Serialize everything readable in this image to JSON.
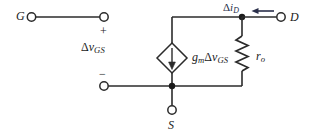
{
  "diagram": {
    "colors": {
      "wire": "#2b2b2b",
      "label": "#1b1b1b",
      "current_label": "#2a2f4a",
      "background": "#ffffff"
    },
    "terminals": [
      {
        "id": "gate",
        "label": "G",
        "x": 31,
        "y": 17
      },
      {
        "id": "gate_plus_node",
        "label": "",
        "x": 104,
        "y": 17
      },
      {
        "id": "gate_minus_node",
        "label": "",
        "x": 104,
        "y": 86
      },
      {
        "id": "drain",
        "label": "D",
        "x": 281,
        "y": 17
      },
      {
        "id": "source",
        "label": "S",
        "x": 172,
        "y": 110
      }
    ],
    "polarity": {
      "plus": "+",
      "minus": "−"
    },
    "labels": {
      "gate": "G",
      "drain": "D",
      "source": "S",
      "input_voltage": {
        "delta": "Δ",
        "symbol": "v",
        "subscript": "GS"
      },
      "dependent_source": {
        "gm": "g",
        "gm_sub": "m",
        "delta": "Δ",
        "symbol": "v",
        "subscript": "GS"
      },
      "output_resistance": {
        "symbol": "r",
        "subscript": "o"
      },
      "drain_current": {
        "delta": "Δ",
        "symbol": "i",
        "subscript": "D"
      }
    },
    "elements": [
      {
        "id": "dependent-current-source",
        "type": "diamond",
        "cx": 172,
        "cy": 58,
        "rx": 15,
        "ry": 15,
        "arrow": "down"
      },
      {
        "id": "output-resistor",
        "type": "resistor",
        "x": 242,
        "y_top": 36,
        "y_bottom": 74,
        "orientation": "vertical"
      },
      {
        "id": "drain-current-arrow",
        "type": "arrow",
        "direction": "left",
        "x_from": 274,
        "x_to": 252,
        "y": 11
      }
    ],
    "nodes": [
      {
        "id": "drain-node",
        "x": 242,
        "y": 17
      },
      {
        "id": "source-node",
        "x": 172,
        "y": 86
      }
    ]
  }
}
